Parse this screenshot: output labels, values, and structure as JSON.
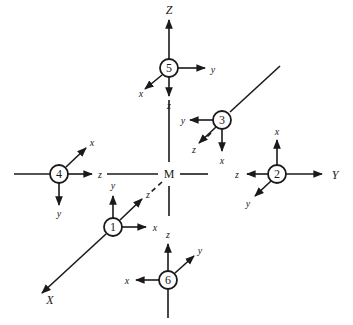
{
  "diagram": {
    "center_label": "M",
    "global_axes": {
      "Z": "Z",
      "Y": "Y",
      "X": "X"
    },
    "nodes": [
      {
        "id": "1",
        "labels": {
          "y": "y",
          "x": "x",
          "z": "z"
        }
      },
      {
        "id": "2",
        "labels": {
          "x": "x",
          "z": "z",
          "y": "y"
        }
      },
      {
        "id": "3",
        "labels": {
          "y": "y",
          "z": "z",
          "x": "x"
        }
      },
      {
        "id": "4",
        "labels": {
          "x": "x",
          "z": "z",
          "y": "y"
        }
      },
      {
        "id": "5",
        "labels": {
          "y": "y",
          "x": "x",
          "z": "z"
        }
      },
      {
        "id": "6",
        "labels": {
          "y": "y",
          "x": "x",
          "z": "z"
        }
      }
    ]
  }
}
